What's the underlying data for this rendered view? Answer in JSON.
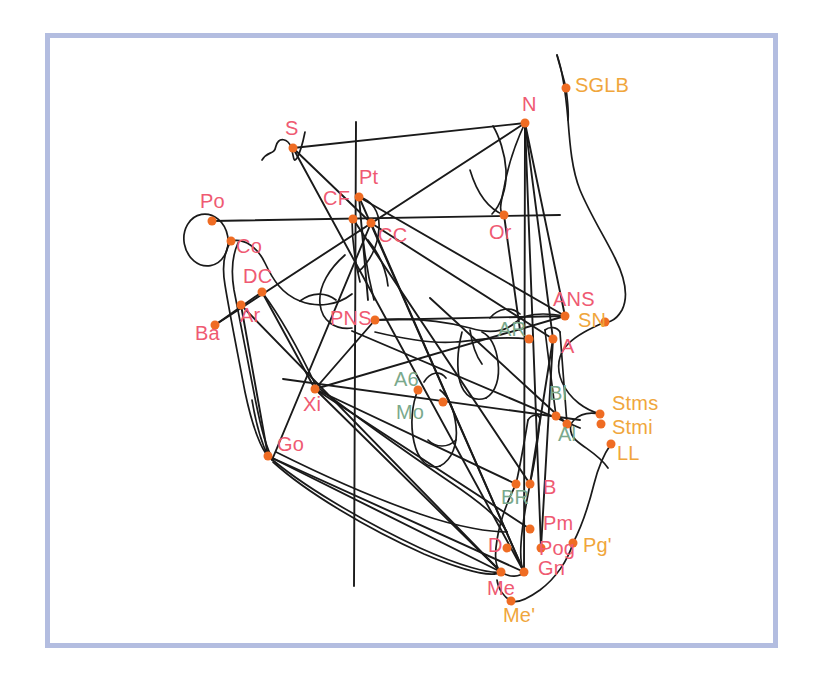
{
  "figure": {
    "frame_color": "#b3bde0",
    "background_color": "#ffffff",
    "tracing_color": "#1a1a1a",
    "point_color": "#ef6c23",
    "point_radius": 4.5
  },
  "legend_colors": {
    "skeletal": "#ef5a72",
    "dental": "#7aa98c",
    "soft_tissue": "#f0a63c"
  },
  "chart_data": {
    "type": "scatter",
    "xlabel": "",
    "ylabel": "",
    "xlim": [
      45,
      778
    ],
    "ylim": [
      33,
      648
    ],
    "grid": false,
    "legend": "none",
    "series": [
      {
        "name": "skeletal",
        "color": "#ef5a72",
        "points": [
          {
            "label": "S",
            "x": 293,
            "y": 148,
            "lx": 285,
            "ly": 118
          },
          {
            "label": "N",
            "x": 525,
            "y": 123,
            "lx": 522,
            "ly": 94
          },
          {
            "label": "Po",
            "x": 212,
            "y": 221,
            "lx": 200,
            "ly": 191
          },
          {
            "label": "Pt",
            "x": 359,
            "y": 197,
            "lx": 359,
            "ly": 167
          },
          {
            "label": "CF",
            "x": 353,
            "y": 219,
            "lx": 323,
            "ly": 188
          },
          {
            "label": "CC",
            "x": 371,
            "y": 223,
            "lx": 378,
            "ly": 225
          },
          {
            "label": "Or",
            "x": 504,
            "y": 215,
            "lx": 489,
            "ly": 222
          },
          {
            "label": "Co",
            "x": 231,
            "y": 241,
            "lx": 236,
            "ly": 236
          },
          {
            "label": "DC",
            "x": 262,
            "y": 292,
            "lx": 243,
            "ly": 266
          },
          {
            "label": "Ar",
            "x": 241,
            "y": 305,
            "lx": 240,
            "ly": 305
          },
          {
            "label": "Ba",
            "x": 215,
            "y": 325,
            "lx": 195,
            "ly": 323
          },
          {
            "label": "PNS",
            "x": 375,
            "y": 320,
            "lx": 330,
            "ly": 308
          },
          {
            "label": "ANS",
            "x": 565,
            "y": 316,
            "lx": 553,
            "ly": 289
          },
          {
            "label": "A",
            "x": 553,
            "y": 339,
            "lx": 561,
            "ly": 336
          },
          {
            "label": "Xi",
            "x": 315,
            "y": 389,
            "lx": 303,
            "ly": 394
          },
          {
            "label": "Go",
            "x": 268,
            "y": 456,
            "lx": 277,
            "ly": 434
          },
          {
            "label": "B",
            "x": 530,
            "y": 484,
            "lx": 543,
            "ly": 477
          },
          {
            "label": "Pm",
            "x": 530,
            "y": 529,
            "lx": 543,
            "ly": 513
          },
          {
            "label": "D",
            "x": 507,
            "y": 548,
            "lx": 488,
            "ly": 535
          },
          {
            "label": "Pog",
            "x": 541,
            "y": 548,
            "lx": 539,
            "ly": 538
          },
          {
            "label": "Gn",
            "x": 524,
            "y": 572,
            "lx": 538,
            "ly": 558
          },
          {
            "label": "Me",
            "x": 501,
            "y": 572,
            "lx": 487,
            "ly": 578
          }
        ]
      },
      {
        "name": "dental",
        "color": "#7aa98c",
        "points": [
          {
            "label": "AR",
            "x": 529,
            "y": 339,
            "lx": 498,
            "ly": 319
          },
          {
            "label": "A6",
            "x": 418,
            "y": 390,
            "lx": 394,
            "ly": 369
          },
          {
            "label": "Mo",
            "x": 443,
            "y": 402,
            "lx": 396,
            "ly": 402
          },
          {
            "label": "Bl",
            "x": 556,
            "y": 416,
            "lx": 549,
            "ly": 383
          },
          {
            "label": "Al",
            "x": 567,
            "y": 424,
            "lx": 558,
            "ly": 424
          },
          {
            "label": "BR",
            "x": 516,
            "y": 484,
            "lx": 501,
            "ly": 487
          }
        ]
      },
      {
        "name": "soft_tissue",
        "color": "#f0a63c",
        "points": [
          {
            "label": "SGLB",
            "x": 566,
            "y": 88,
            "lx": 575,
            "ly": 75
          },
          {
            "label": "SN",
            "x": 605,
            "y": 322,
            "lx": 578,
            "ly": 310
          },
          {
            "label": "Stms",
            "x": 600,
            "y": 414,
            "lx": 612,
            "ly": 393
          },
          {
            "label": "Stmi",
            "x": 601,
            "y": 424,
            "lx": 612,
            "ly": 417
          },
          {
            "label": "LL",
            "x": 611,
            "y": 444,
            "lx": 617,
            "ly": 443
          },
          {
            "label": "Pg'",
            "x": 573,
            "y": 543,
            "lx": 583,
            "ly": 535
          },
          {
            "label": "Me'",
            "x": 511,
            "y": 601,
            "lx": 503,
            "ly": 605
          }
        ]
      }
    ]
  }
}
